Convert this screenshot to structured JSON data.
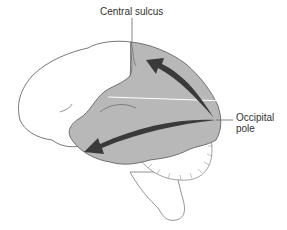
{
  "diagram": {
    "type": "anatomical-illustration",
    "labels": {
      "central_sulcus": "Central sulcus",
      "occipital_pole_line1": "Occipital",
      "occipital_pole_line2": "pole"
    },
    "regions": [
      {
        "name": "frontal-lobe",
        "fill": "#ffffff"
      },
      {
        "name": "posterior-cortex",
        "fill": "#b8b8b8"
      },
      {
        "name": "cerebellum",
        "fill": "#ffffff"
      },
      {
        "name": "brainstem",
        "fill": "#ffffff"
      }
    ],
    "arrows": [
      {
        "name": "dorsal-stream-arrow",
        "from": "occipital pole",
        "to": "parietal region near central sulcus",
        "color": "#3a3a3a"
      },
      {
        "name": "ventral-stream-arrow",
        "from": "occipital pole",
        "to": "anterior temporal lobe",
        "color": "#3a3a3a"
      }
    ],
    "colors": {
      "shaded_region": "#b8b8b8",
      "outline": "#555555",
      "arrow": "#3a3a3a",
      "text": "#333333"
    }
  }
}
